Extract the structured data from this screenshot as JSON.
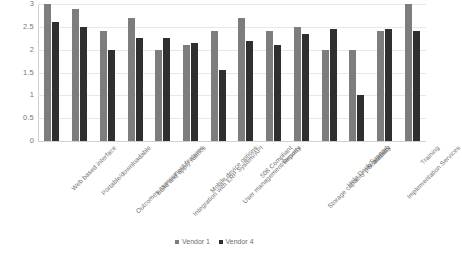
{
  "chart_data": {
    "type": "bar",
    "title": "",
    "subtitle": "",
    "xlabel": "",
    "ylabel": "",
    "ylim": [
      0,
      3
    ],
    "yticks": [
      "0",
      "0.5",
      "1",
      "1.5",
      "2",
      "2.5",
      "3"
    ],
    "ytick_values": [
      0,
      0.5,
      1,
      1.5,
      2,
      2.5,
      3
    ],
    "grid": true,
    "legend_position": "bottom",
    "categories": [
      "Web based interface",
      "Portable/downloadable",
      "Outcomes assessment features",
      "Build and apply rubrics",
      "Integration with ERP System/API",
      "Mobile device options",
      "User management/security",
      "508 Compliant",
      "Reports",
      "Storage capacity per account",
      "Help Desk/Support",
      "Scalability",
      "Implementation Services",
      "Training"
    ],
    "series": [
      {
        "name": "Vendor 1",
        "color": "#7d7d7d",
        "values": [
          3.0,
          2.9,
          2.4,
          2.7,
          2.0,
          2.1,
          2.4,
          2.7,
          2.4,
          2.5,
          2.0,
          2.0,
          2.4,
          3.0
        ]
      },
      {
        "name": "Vendor 4",
        "color": "#2f2f2f",
        "values": [
          2.6,
          2.5,
          2.0,
          2.25,
          2.25,
          2.15,
          1.55,
          2.2,
          2.1,
          2.35,
          2.45,
          1.0,
          2.45,
          2.4
        ]
      }
    ]
  },
  "legend": {
    "items": [
      {
        "label": "Vendor 1",
        "series": 0
      },
      {
        "label": "Vendor 4",
        "series": 1
      }
    ]
  }
}
